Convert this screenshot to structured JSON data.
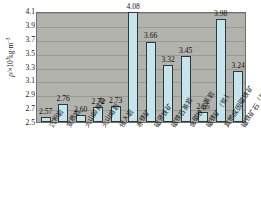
{
  "chart_data": {
    "type": "bar",
    "title": "",
    "xlabel": "",
    "ylabel": "ρ/×10³kg·m⁻³",
    "ylabel_parts": {
      "symbol": "ρ",
      "separator": "/×10",
      "exponent": "3",
      "unit": "kg·m",
      "unit_exponent": "-3"
    },
    "ylim": [
      2.5,
      4.1
    ],
    "ytick_step": 0.2,
    "yticks": [
      "2.5",
      "2.7",
      "2.9",
      "3.1",
      "3.3",
      "3.5",
      "3.7",
      "3.9",
      "4.1"
    ],
    "grid": true,
    "legend": "none",
    "categories": [
      "沉积岩",
      "变质岩",
      "火山碎屑岩",
      "火山熔岩",
      "侵入岩",
      "赤铁矿",
      "磁贤铁矿",
      "磁铁石英岩",
      "含磁铁石英岩",
      "磁铁矿（贫）",
      "其他成因磁铁矿",
      "磁铁矿石（矿）"
    ],
    "values": [
      2.57,
      2.76,
      2.6,
      2.72,
      2.73,
      4.08,
      3.66,
      3.32,
      3.45,
      2.65,
      3.98,
      3.24
    ],
    "value_labels": [
      "2.57",
      "2.76",
      "2.60",
      "2.72",
      "2.73",
      "4.08",
      "3.66",
      "3.32",
      "3.45",
      "2.65",
      "3.98",
      "3.24"
    ],
    "colors": {
      "bar_fill": "#c5e4ec",
      "bar_border": "#2c3a3e",
      "plot_background": "#b3b3ad",
      "gridline": "#9a9a94",
      "text": "#161616"
    }
  }
}
